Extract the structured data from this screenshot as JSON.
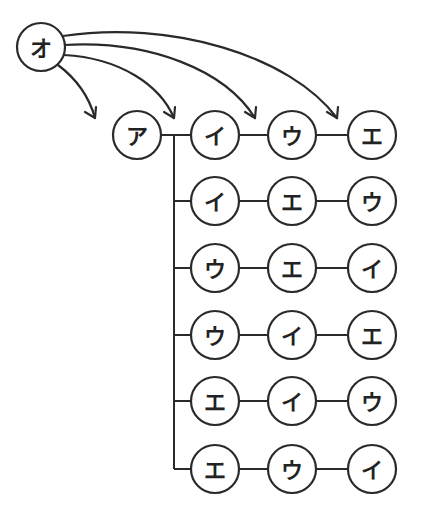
{
  "diagram": {
    "type": "tree",
    "root": {
      "label": "オ",
      "cx": 41,
      "cy": 47
    },
    "start": {
      "label": "ア",
      "cx": 137,
      "cy": 135
    },
    "trunk_x": 174,
    "columns_x": [
      215,
      292,
      372
    ],
    "rows": [
      {
        "y": 135,
        "labels": [
          "イ",
          "ウ",
          "エ"
        ]
      },
      {
        "y": 201,
        "labels": [
          "イ",
          "エ",
          "ウ"
        ]
      },
      {
        "y": 268,
        "labels": [
          "ウ",
          "エ",
          "イ"
        ]
      },
      {
        "y": 335,
        "labels": [
          "ウ",
          "イ",
          "エ"
        ]
      },
      {
        "y": 401,
        "labels": [
          "エ",
          "イ",
          "ウ"
        ]
      },
      {
        "y": 469,
        "labels": [
          "エ",
          "ウ",
          "イ"
        ]
      }
    ],
    "arrows_from_root": [
      {
        "target": "before ア",
        "end": [
          95,
          118
        ]
      },
      {
        "target": "before イ",
        "end": [
          174,
          118
        ]
      },
      {
        "target": "before ウ",
        "end": [
          255,
          118
        ]
      },
      {
        "target": "before エ",
        "end": [
          337,
          118
        ]
      }
    ],
    "node_radius": 24
  }
}
